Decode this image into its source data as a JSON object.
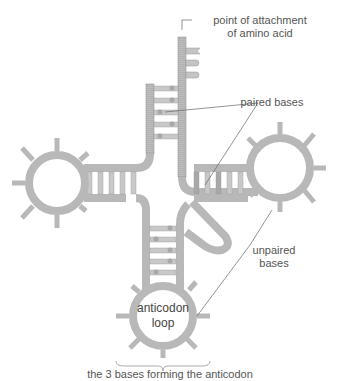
{
  "diagram": {
    "labels": {
      "attachment_line1": "point of attachment",
      "attachment_line2": "of amino acid",
      "paired": "paired bases",
      "unpaired_line1": "unpaired",
      "unpaired_line2": "bases",
      "anticodon_line1": "anticodon",
      "anticodon_line2": "loop",
      "anticodon_bases": "the 3 bases forming the anticodon"
    },
    "colors": {
      "strand": "#b8b8b8",
      "strand_edge": "#8e8e8e",
      "base": "#c9c9c9",
      "base_dark": "#a0a0a0",
      "leader": "#666666",
      "text": "#555555"
    }
  }
}
